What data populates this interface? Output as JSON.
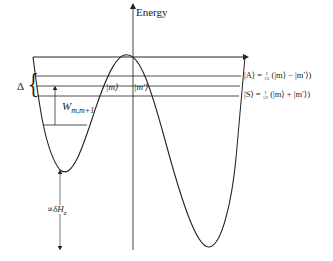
{
  "diagram": {
    "axis": {
      "label": "Energy"
    },
    "labels": {
      "delta": "Δ",
      "brace": "{",
      "w_main": "W",
      "w_sub": "m,m+1",
      "ket_m": "|m⟩",
      "ket_mprime": "|m′⟩",
      "antisym": "|A⟩ = ",
      "antisym_tail": "(|m⟩ − |m′⟩)",
      "sym": "|S⟩ = ",
      "sym_tail": "(|m⟩ + |m′⟩)",
      "frac_num": "1",
      "frac_den": "√2",
      "zeeman": "∝δH",
      "zeeman_sub": "z"
    },
    "colors": {
      "line": "#222222",
      "background": "#ffffff"
    }
  }
}
